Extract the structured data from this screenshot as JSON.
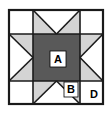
{
  "figure": {
    "name": "sawtooth-star-quilt-block",
    "shape": "square",
    "grid": "3x3",
    "width_px": 112,
    "height_px": 113
  },
  "colors": {
    "outline": "#1a1a1a",
    "center_dark": "#595959",
    "point_light": "#d4d4d4",
    "corner_white": "#ffffff",
    "background": "#ffffff",
    "label_text": "#000000",
    "label_box_fill": "#ffffff"
  },
  "labels": [
    {
      "id": "A",
      "text": "A",
      "piece": "center-square",
      "x": 58,
      "y": 59
    },
    {
      "id": "B",
      "text": "B",
      "piece": "star-point-triangle",
      "x": 71,
      "y": 90
    },
    {
      "id": "D",
      "text": "D",
      "piece": "corner-square",
      "x": 94,
      "y": 95
    }
  ],
  "pieces": {
    "center_square": {
      "label": "A",
      "fill": "center_dark",
      "description": "Large dark center square"
    },
    "star_point": {
      "label": "B",
      "fill": "point_light",
      "description": "Light gray star point triangles, two per side unit"
    },
    "background_triangle": {
      "label": "",
      "fill": "corner_white",
      "description": "White background triangle in each side unit"
    },
    "corner_square": {
      "label": "D",
      "fill": "corner_white",
      "description": "Plain white corner squares"
    }
  },
  "geometry": {
    "frame": {
      "x": 9,
      "y": 10,
      "w": 94,
      "h": 94
    },
    "col_edges": [
      9,
      33,
      80,
      103
    ],
    "row_edges": [
      10,
      34,
      81,
      104
    ]
  }
}
